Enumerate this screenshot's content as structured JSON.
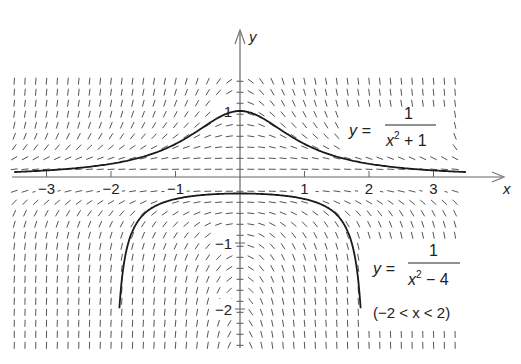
{
  "diagram": {
    "differential_equation": "dy/dx = -2xy^2",
    "axes": {
      "x_label": "x",
      "y_label": "y",
      "x_ticks": [
        {
          "value": -3,
          "label": "−3"
        },
        {
          "value": -2,
          "label": "−2"
        },
        {
          "value": -1,
          "label": "−1"
        },
        {
          "value": 1,
          "label": "1"
        },
        {
          "value": 2,
          "label": "2"
        },
        {
          "value": 3,
          "label": "3"
        }
      ],
      "y_ticks": [
        {
          "value": 1,
          "label": "1"
        },
        {
          "value": -1,
          "label": "−1"
        },
        {
          "value": -2,
          "label": "−2"
        }
      ]
    },
    "field": {
      "x_min": -3.5,
      "x_max": 3.5,
      "x_step": 0.1667,
      "y_min": -2.55,
      "y_max": 1.55,
      "y_step": 0.1667,
      "segment_length": 7,
      "color": "#555555"
    },
    "curves": [
      {
        "name": "upper-solution",
        "equation_lhs": "y =",
        "numerator": "1",
        "denominator_base": "x",
        "denominator_exp": "2",
        "denominator_rest": "+ 1",
        "domain": [
          -3.5,
          3.5
        ],
        "formula": "1/(x^2+1)"
      },
      {
        "name": "lower-solution",
        "equation_lhs": "y =",
        "numerator": "1",
        "denominator_base": "x",
        "denominator_exp": "2",
        "denominator_rest": "− 4",
        "domain_label": "(−2 < x < 2)",
        "domain": [
          -1.87,
          1.87
        ],
        "formula": "1/(x^2-4)"
      }
    ],
    "colors": {
      "curve": "#1a1a1a",
      "axis": "#666666",
      "text": "#222222",
      "background": "#ffffff"
    }
  }
}
